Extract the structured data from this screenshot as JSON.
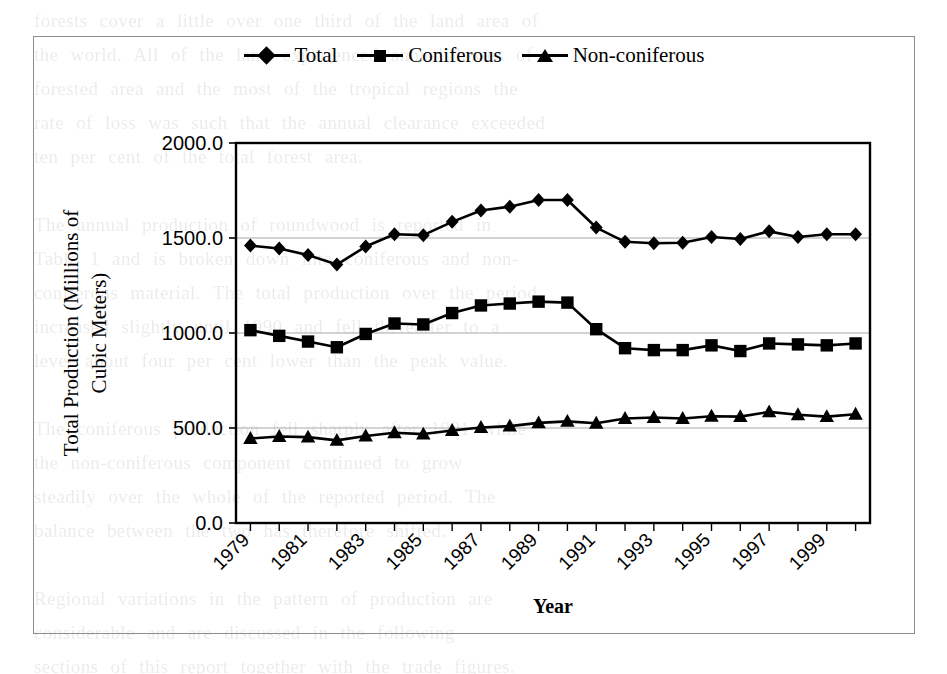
{
  "figure": {
    "background_text_lines": [
      "forests cover a little over one third of the land area of",
      "the world. All of the land experienced annual losses of",
      "forested area and the most of the tropical regions the",
      "rate of loss was such that the annual clearance exceeded",
      "ten per cent of the total forest area.",
      "",
      "The annual production of roundwood is reported in",
      "Table 1 and is broken down into coniferous and non-",
      "coniferous material. The total production over the period",
      "increased slightly until 1990 and fell thereafter to a",
      "level about four per cent lower than the peak value.",
      "",
      "The coniferous production fell sharply after 1991 while",
      "the non-coniferous component continued to grow",
      "steadily over the whole of the reported period. The",
      "balance between the two has therefore shifted.",
      "",
      "Regional variations in the pattern of production are",
      "considerable and are discussed in the following",
      "sections of this report together with the trade figures."
    ]
  },
  "chart_data": {
    "type": "line",
    "title": "",
    "xlabel": "Year",
    "ylabel": "Total Production (Millions of Cubic Meters)",
    "ylabel_lines": [
      "Total Production (Millions of",
      "Cubic Meters)"
    ],
    "x": [
      1979,
      1980,
      1981,
      1982,
      1983,
      1984,
      1985,
      1986,
      1987,
      1988,
      1989,
      1990,
      1991,
      1992,
      1993,
      1994,
      1995,
      1996,
      1997,
      1998,
      1999,
      2000
    ],
    "xtick_labels": [
      "1979",
      "1981",
      "1983",
      "1985",
      "1987",
      "1989",
      "1991",
      "1993",
      "1995",
      "1997",
      "1999"
    ],
    "xtick_values": [
      1979,
      1981,
      1983,
      1985,
      1987,
      1989,
      1991,
      1993,
      1995,
      1997,
      1999
    ],
    "xtick_rotation_deg": 45,
    "ytick_labels": [
      "0.0",
      "500.0",
      "1000.0",
      "1500.0",
      "2000.0"
    ],
    "ytick_values": [
      0,
      500,
      1000,
      1500,
      2000
    ],
    "ylim": [
      0,
      2000
    ],
    "xlim": [
      1978.5,
      2000.5
    ],
    "grid": "horizontal",
    "legend_position": "top-center",
    "series": [
      {
        "name": "Total",
        "marker": "diamond",
        "color": "#000000",
        "values": [
          1460,
          1445,
          1410,
          1360,
          1455,
          1520,
          1515,
          1585,
          1645,
          1665,
          1700,
          1700,
          1555,
          1480,
          1472,
          1475,
          1505,
          1495,
          1535,
          1505,
          1520,
          1520
        ]
      },
      {
        "name": "Coniferous",
        "marker": "square",
        "color": "#000000",
        "values": [
          1015,
          985,
          955,
          925,
          995,
          1050,
          1045,
          1105,
          1145,
          1155,
          1165,
          1160,
          1020,
          920,
          910,
          910,
          935,
          905,
          945,
          940,
          935,
          945
        ]
      },
      {
        "name": "Non-coniferous",
        "marker": "triangle",
        "color": "#000000",
        "values": [
          445,
          455,
          452,
          435,
          458,
          475,
          468,
          487,
          503,
          510,
          527,
          535,
          525,
          550,
          555,
          550,
          562,
          560,
          585,
          570,
          560,
          572
        ]
      }
    ]
  }
}
